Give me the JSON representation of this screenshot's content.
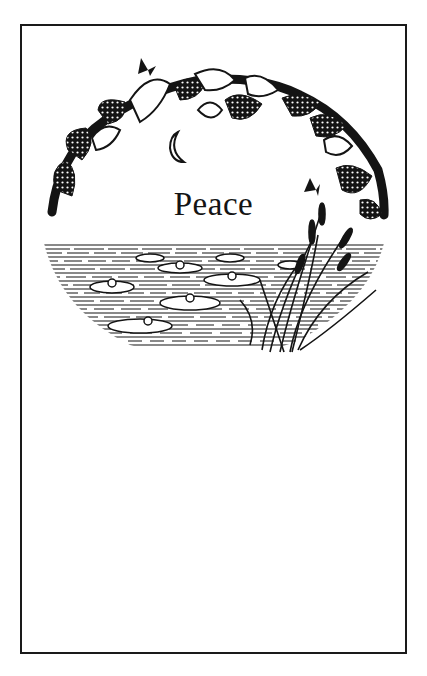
{
  "card": {
    "title": "Peace",
    "border_color": "#1a1a1a",
    "ink_color": "#141414",
    "background": "#ffffff"
  },
  "illustration": {
    "elements": [
      "flower-wreath",
      "butterfly-top-left",
      "butterfly-right",
      "crescent-moon",
      "pond-water",
      "water-lilies",
      "cattails-reeds"
    ]
  }
}
